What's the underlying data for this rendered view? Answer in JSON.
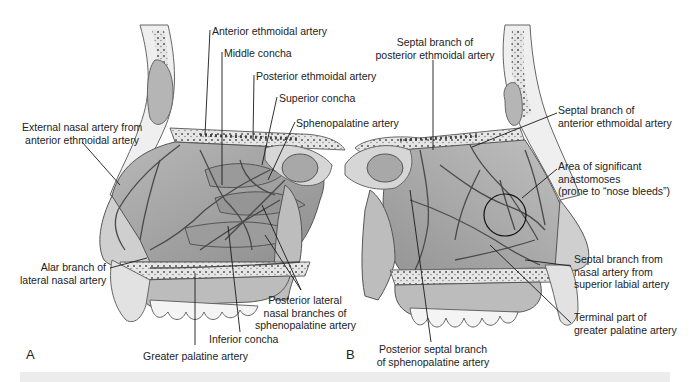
{
  "figure": {
    "panels": [
      {
        "id": "A",
        "letter": "A",
        "view": "lateral wall of nasal cavity",
        "labels": {
          "anterior_ethmoidal": "Anterior ethmoidal artery",
          "middle_concha": "Middle concha",
          "posterior_ethmoidal": "Posterior ethmoidal artery",
          "superior_concha": "Superior concha",
          "sphenopalatine": "Sphenopalatine artery",
          "external_nasal_1": "External nasal artery from",
          "external_nasal_2": "anterior ethmoidal artery",
          "alar_1": "Alar branch of",
          "alar_2": "lateral nasal artery",
          "post_lat_1": "Posterior lateral",
          "post_lat_2": "nasal branches of",
          "post_lat_3": "sphenopalatine artery",
          "inferior_concha": "Inferior concha",
          "greater_palatine": "Greater palatine artery"
        }
      },
      {
        "id": "B",
        "letter": "B",
        "view": "nasal septum",
        "labels": {
          "septal_post_eth_1": "Septal branch of",
          "septal_post_eth_2": "posterior ethmoidal artery",
          "septal_ant_eth_1": "Septal branch of",
          "septal_ant_eth_2": "anterior ethmoidal artery",
          "anastomoses_1": "Area of significant",
          "anastomoses_2": "anastomoses",
          "anastomoses_3": "(prone to “nose bleeds”)",
          "septal_labial_1": "Septal branch from",
          "septal_labial_2": "nasal artery from",
          "septal_labial_3": "superior labial artery",
          "terminal_gp_1": "Terminal part of",
          "terminal_gp_2": "greater palatine artery",
          "post_septal_1": "Posterior septal branch",
          "post_septal_2": "of sphenopalatine artery"
        }
      }
    ],
    "colors": {
      "background": "#ffffff",
      "bone": "#e9e9e9",
      "bone_outline": "#6a6a6a",
      "mucosa": "#a9a9a9",
      "mucosa_dark": "#7d7d7d",
      "artery": "#555555",
      "leader": "#1a1a1a",
      "text": "#222222"
    }
  }
}
